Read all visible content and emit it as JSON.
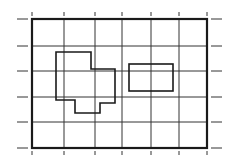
{
  "diagram": {
    "type": "grid-with-shapes",
    "colors": {
      "background": "#ffffff",
      "line": "#1a1a1a",
      "grid": "#333333"
    },
    "grid": {
      "columns": 6,
      "rows": 5,
      "x_lines": [
        32,
        64,
        95,
        122,
        151,
        179,
        207
      ],
      "y_lines": [
        19,
        46,
        71,
        97,
        122,
        148
      ]
    },
    "shapes": [
      {
        "name": "irregular-polygon",
        "points": [
          [
            56,
            52
          ],
          [
            91,
            52
          ],
          [
            91,
            69
          ],
          [
            115,
            69
          ],
          [
            115,
            103
          ],
          [
            100,
            103
          ],
          [
            100,
            113
          ],
          [
            75,
            113
          ],
          [
            75,
            100
          ],
          [
            56,
            100
          ]
        ]
      },
      {
        "name": "rectangle",
        "x": 129,
        "y": 64,
        "width": 44,
        "height": 27
      }
    ]
  }
}
